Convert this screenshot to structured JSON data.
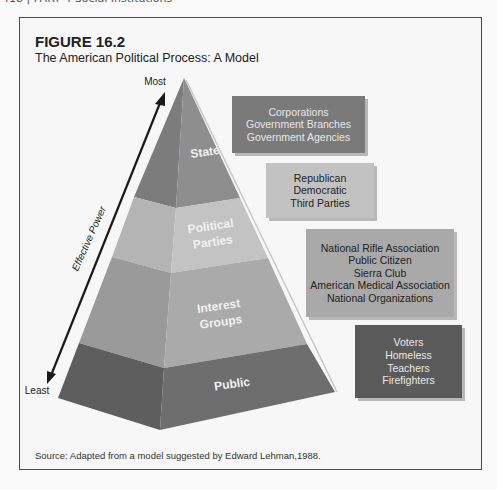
{
  "page_header": "418  |  PART 4   Social Institutions",
  "figure": {
    "number": "FIGURE 16.2",
    "title": "The American Political Process: A Model",
    "source": "Source: Adapted from a model suggested by Edward Lehman,1988."
  },
  "axis": {
    "top_label": "Most",
    "bottom_label": "Least",
    "label": "Effective Power"
  },
  "layers": [
    {
      "name": "State",
      "lines": [
        "State"
      ],
      "color_left": "#7c7c7c",
      "color_right": "#8e8e8e"
    },
    {
      "name": "Political Parties",
      "lines": [
        "Political",
        "Parties"
      ],
      "color_left": "#b4b4b4",
      "color_right": "#c3c3c3"
    },
    {
      "name": "Interest Groups",
      "lines": [
        "Interest",
        "Groups"
      ],
      "color_left": "#9a9a9a",
      "color_right": "#aaaaaa"
    },
    {
      "name": "Public",
      "lines": [
        "Public"
      ],
      "color_left": "#5e5e5e",
      "color_right": "#6e6e6e"
    }
  ],
  "boxes": [
    {
      "layer": "State",
      "items": [
        "Corporations",
        "Government Branches",
        "Government Agencies"
      ],
      "bg": "#7a7a7a",
      "text_color": "#e8e8e8"
    },
    {
      "layer": "Political Parties",
      "items": [
        "Republican",
        "Democratic",
        "Third Parties"
      ],
      "bg": "#c2c2c2",
      "text_color": "#222222"
    },
    {
      "layer": "Interest Groups",
      "items": [
        "National Rifle Association",
        "Public Citizen",
        "Sierra Club",
        "American Medical Association",
        "National Organizations"
      ],
      "bg": "#a9a9a9",
      "text_color": "#222222"
    },
    {
      "layer": "Public",
      "items": [
        "Voters",
        "Homeless",
        "Teachers",
        "Firefighters"
      ],
      "bg": "#5a5a5a",
      "text_color": "#e8e8e8"
    }
  ]
}
